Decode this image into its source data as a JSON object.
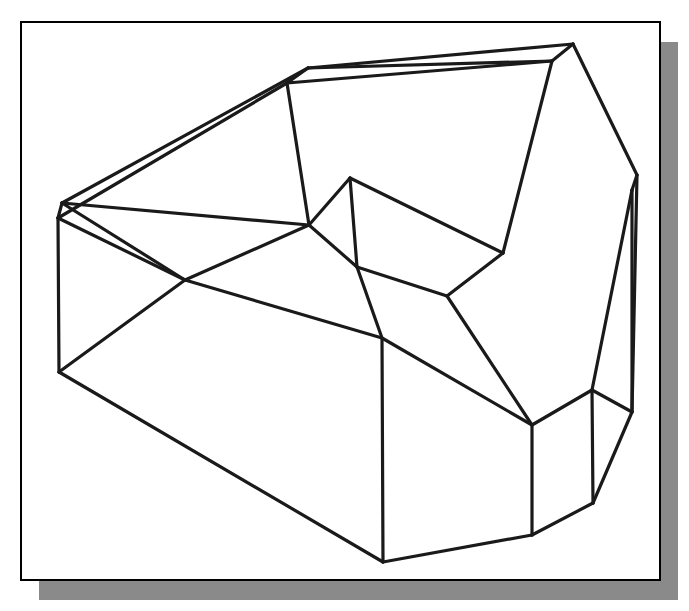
{
  "document": {
    "title": "Isometric wireframe line drawing",
    "background_color": "#ffffff",
    "width": 689,
    "height": 611,
    "faint_top_text": ""
  },
  "frame": {
    "name": "figure-border",
    "x": 21,
    "y": 22,
    "width": 639,
    "height": 558,
    "border_color": "#000000",
    "border_width": 2,
    "fill_color": "#ffffff",
    "shadow": {
      "color": "#8a8a8a",
      "offset_x": 18,
      "offset_y": 20
    }
  },
  "drawing": {
    "name": "wireframe-solid",
    "stroke_color": "#1a1a1a",
    "stroke_width": 3.2,
    "thin_stroke_width": 2.4,
    "description": "3D isometric wireframe of a stepped block with an upper tilted slab, a raised back wall and a lower prismatic base",
    "vertices": {
      "A": [
        58,
        218
      ],
      "B": [
        62,
        203
      ],
      "C": [
        185,
        280
      ],
      "D": [
        59,
        372
      ],
      "E": [
        287,
        83
      ],
      "F": [
        308,
        68
      ],
      "G": [
        552,
        61
      ],
      "H": [
        573,
        44
      ],
      "I": [
        309,
        225
      ],
      "J": [
        350,
        178
      ],
      "K": [
        503,
        253
      ],
      "L": [
        357,
        267
      ],
      "M": [
        382,
        338
      ],
      "N": [
        383,
        562
      ],
      "O": [
        532,
        425
      ],
      "P": [
        532,
        535
      ],
      "Q": [
        593,
        503
      ],
      "R": [
        592,
        390
      ],
      "S": [
        632,
        412
      ],
      "T": [
        632,
        190
      ],
      "U": [
        637,
        175
      ],
      "V": [
        447,
        296
      ]
    },
    "edges": [
      [
        "B",
        "F"
      ],
      [
        "A",
        "E"
      ],
      [
        "A",
        "B"
      ],
      [
        "A",
        "D"
      ],
      [
        "B",
        "C"
      ],
      [
        "C",
        "A"
      ],
      [
        "C",
        "M"
      ],
      [
        "D",
        "C"
      ],
      [
        "D",
        "N"
      ],
      [
        "E",
        "F"
      ],
      [
        "E",
        "I"
      ],
      [
        "F",
        "H"
      ],
      [
        "G",
        "H"
      ],
      [
        "E",
        "G"
      ],
      [
        "F",
        "G"
      ],
      [
        "H",
        "U"
      ],
      [
        "G",
        "K"
      ],
      [
        "I",
        "J"
      ],
      [
        "I",
        "L"
      ],
      [
        "J",
        "K"
      ],
      [
        "J",
        "L"
      ],
      [
        "L",
        "V"
      ],
      [
        "K",
        "V"
      ],
      [
        "V",
        "O"
      ],
      [
        "L",
        "M"
      ],
      [
        "M",
        "N"
      ],
      [
        "M",
        "O"
      ],
      [
        "N",
        "P"
      ],
      [
        "O",
        "P"
      ],
      [
        "O",
        "R"
      ],
      [
        "P",
        "Q"
      ],
      [
        "Q",
        "R"
      ],
      [
        "Q",
        "S"
      ],
      [
        "R",
        "S"
      ],
      [
        "R",
        "T"
      ],
      [
        "S",
        "T"
      ],
      [
        "T",
        "U"
      ],
      [
        "U",
        "S"
      ],
      [
        "B",
        "I"
      ],
      [
        "I",
        "C"
      ]
    ]
  }
}
